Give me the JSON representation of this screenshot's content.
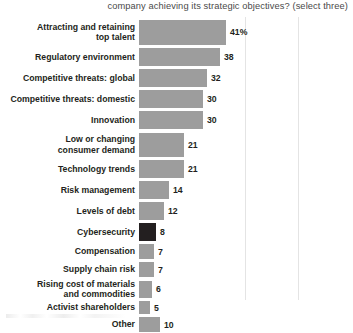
{
  "chart_data": {
    "type": "bar",
    "orientation": "horizontal",
    "title": "company achieving its strategic objectives? (select three)",
    "xlabel": "",
    "ylabel": "",
    "xlim": [
      0,
      50
    ],
    "grid": true,
    "gridlines_x": [
      50,
      75
    ],
    "legend": "none",
    "unit_suffix": "%",
    "categories": [
      "Attracting and retaining top talent",
      "Regulatory environment",
      "Competitive threats: global",
      "Competitive threats: domestic",
      "Innovation",
      "Low or changing consumer demand",
      "Technology trends",
      "Risk management",
      "Levels of debt",
      "Cybersecurity",
      "Compensation",
      "Supply chain risk",
      "Rising cost of materials and commodities",
      "Activist shareholders",
      "Other"
    ],
    "values": [
      41,
      38,
      32,
      30,
      30,
      21,
      21,
      14,
      12,
      8,
      7,
      7,
      6,
      5,
      10
    ],
    "value_labels": [
      "41%",
      "38",
      "32",
      "30",
      "30",
      "21",
      "21",
      "14",
      "12",
      "8",
      "7",
      "7",
      "6",
      "5",
      "10"
    ],
    "highlight_category": "Cybersecurity",
    "colors": {
      "bar": "#9d9d9d",
      "highlight_bar": "#231f20",
      "text": "#231f20",
      "title_text": "#4a4a4a",
      "gridline": "#e4e4e4",
      "background": "#ffffff"
    }
  },
  "rows": [
    {
      "label_line1": "Attracting and retaining",
      "label_line2": "top talent",
      "value": "41%"
    },
    {
      "label_line1": "Regulatory environment",
      "label_line2": "",
      "value": "38"
    },
    {
      "label_line1": "Competitive threats: global",
      "label_line2": "",
      "value": "32"
    },
    {
      "label_line1": "Competitive threats: domestic",
      "label_line2": "",
      "value": "30"
    },
    {
      "label_line1": "Innovation",
      "label_line2": "",
      "value": "30"
    },
    {
      "label_line1": "Low or changing",
      "label_line2": "consumer demand",
      "value": "21"
    },
    {
      "label_line1": "Technology trends",
      "label_line2": "",
      "value": "21"
    },
    {
      "label_line1": "Risk management",
      "label_line2": "",
      "value": "14"
    },
    {
      "label_line1": "Levels of debt",
      "label_line2": "",
      "value": "12"
    },
    {
      "label_line1": "Cybersecurity",
      "label_line2": "",
      "value": "8"
    },
    {
      "label_line1": "Compensation",
      "label_line2": "",
      "value": "7"
    },
    {
      "label_line1": "Supply chain risk",
      "label_line2": "",
      "value": "7"
    },
    {
      "label_line1": "Rising cost of materials",
      "label_line2": "and commodities",
      "value": "6"
    },
    {
      "label_line1": "Activist shareholders",
      "label_line2": "",
      "value": "5"
    },
    {
      "label_line1": "Other",
      "label_line2": "",
      "value": "10"
    }
  ]
}
